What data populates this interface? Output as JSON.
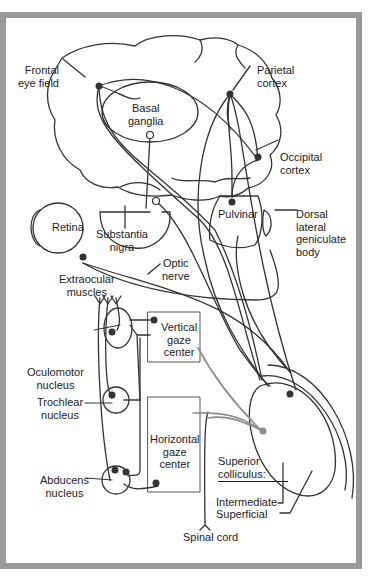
{
  "diagram": {
    "type": "neuroanatomy-schematic",
    "colors": {
      "frame": "#9a9a9a",
      "ink": "#333333",
      "colliculus_output": "#8c8c8c",
      "background": "#ffffff"
    },
    "labels": {
      "frontal_eye_field": "Frontal\neye field",
      "parietal_cortex": "Parietal\ncortex",
      "basal_ganglia": "Basal\nganglia",
      "occipital_cortex": "Occipital\ncortex",
      "retina": "Retina",
      "substantia_nigra": "Substantia\nnigra",
      "pulvinar": "Pulvinar",
      "dorsal_lgn": "Dorsal\nlateral\ngeniculate\nbody",
      "optic_nerve": "Optic\nnerve",
      "extraocular_muscles": "Extraocular\nmuscles",
      "oculomotor_nucleus": "Oculomotor\nnucleus",
      "trochlear_nucleus": "Trochlear\nnucleus",
      "abducens_nucleus": "Abducens\nnucleus",
      "vertical_gaze_center": "Vertical\ngaze\ncenter",
      "horizontal_gaze_center": "Horizontal\ngaze\ncenter",
      "superior_colliculus": "Superior\ncolliculus:",
      "intermediate": "Intermediate",
      "superficial": "Superficial",
      "spinal_cord": "Spinal cord"
    }
  }
}
